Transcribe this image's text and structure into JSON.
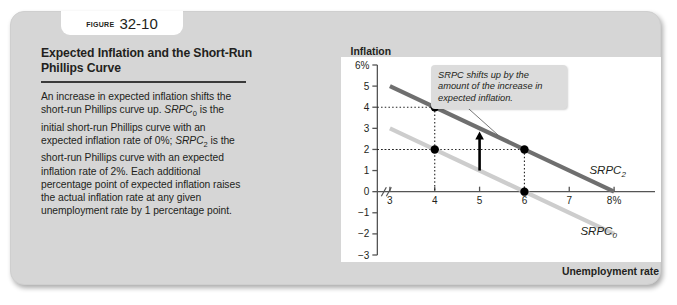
{
  "figure": {
    "label_word": "Figure",
    "number": "32-10",
    "title": "Expected Inflation and the Short-Run Phillips Curve",
    "body_html": "An increase in expected inflation shifts the short-run Phillips curve up. <i>SRPC</i><sub>0</sub> is the initial short-run Phillips curve with an expected inflation rate of 0%; <i>SRPC</i><sub>2</sub> is the short-run Phillips curve with an expected inflation rate of 2%. Each additional percentage point of expected inflation raises the actual inflation rate at any given unemployment rate by 1 percentage point.",
    "body_text": "An increase in expected inflation shifts the short-run Phillips curve up. SRPC0 is the initial short-run Phillips curve with an expected inflation rate of 0%; SRPC2 is the short-run Phillips curve with an expected inflation rate of 2%. Each additional percentage point of expected inflation raises the actual inflation rate at any given unemployment rate by 1 percentage point."
  },
  "callout": {
    "text": "SRPC shifts up by the amount of the increase in expected inflation."
  },
  "chart_data": {
    "type": "line",
    "title": "Expected Inflation and the Short-Run Phillips Curve",
    "xlabel": "Unemployment rate",
    "ylabel": "Inflation rate",
    "xlim": [
      2.4,
      8.6
    ],
    "ylim": [
      -3,
      6
    ],
    "grid": false,
    "axis_break": "//",
    "x_ticks": [
      3,
      4,
      5,
      6,
      7,
      8
    ],
    "x_tick_labels": [
      "3",
      "4",
      "5",
      "6",
      "7",
      "8%"
    ],
    "y_ticks": [
      6,
      5,
      4,
      3,
      2,
      1,
      0,
      -1,
      -2,
      -3
    ],
    "y_tick_labels": [
      "6%",
      "5",
      "4",
      "3",
      "2",
      "1",
      "0",
      "−1",
      "−2",
      "−3"
    ],
    "series": [
      {
        "name": "SRPC2",
        "label": "SRPC",
        "label_sub": "2",
        "color": "#6f6f6f",
        "expected_inflation": "2%",
        "x": [
          3,
          8
        ],
        "y": [
          5,
          0
        ]
      },
      {
        "name": "SRPC0",
        "label": "SRPC",
        "label_sub": "0",
        "color": "#cdcdcd",
        "expected_inflation": "0%",
        "x": [
          3,
          8
        ],
        "y": [
          3,
          -2
        ]
      }
    ],
    "points": [
      {
        "x": 4,
        "y": 4,
        "on": "SRPC2"
      },
      {
        "x": 6,
        "y": 2,
        "on": "SRPC2"
      },
      {
        "x": 4,
        "y": 2,
        "on": "SRPC0"
      },
      {
        "x": 6,
        "y": 0,
        "on": "SRPC0"
      }
    ],
    "annotation_arrow": {
      "x": 5,
      "y_start": 1,
      "y_end": 2.75,
      "direction": "up",
      "color": "#000000"
    },
    "colors": {
      "srpc2": "#6f6f6f",
      "srpc0": "#cdcdcd",
      "point": "#000000",
      "axis": "#555555"
    }
  }
}
